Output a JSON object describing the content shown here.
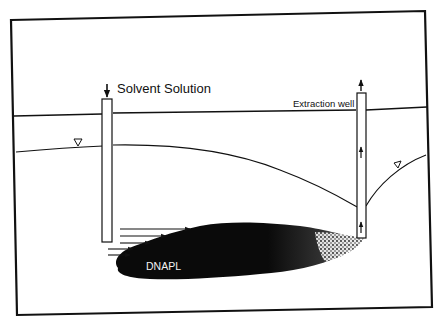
{
  "diagram": {
    "labels": {
      "injection": "Solvent Solution",
      "extraction": "Extraction well",
      "contaminant": "DNAPL"
    },
    "colors": {
      "background": "#ffffff",
      "ink": "#111111",
      "dnapl": "#0a0a0a"
    },
    "elements": {
      "frame": "border rectangle",
      "ground_surface": "horizontal line",
      "water_table": "curved line with drawdown cone at extraction well",
      "water_table_markers": 2,
      "injection_well": "left vertical casing with downward arrow",
      "extraction_well": "right vertical casing with upward arrows",
      "flow_arrows": 5
    }
  }
}
